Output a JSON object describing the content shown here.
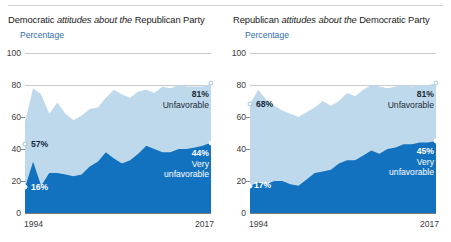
{
  "figure": {
    "background_color": "#ffffff",
    "divider_color": "#d2d2d2",
    "colors": {
      "unfavorable_area": "#bfd9ec",
      "very_unfavorable_area": "#1272bf",
      "accent_blue_text": "#2f6fad",
      "gridline": "#c9c9c9",
      "axis": "#7d7d7d",
      "label_dark": "#1c2b36",
      "label_white": "#ffffff"
    }
  },
  "panels": [
    {
      "id": "democratic-attitudes",
      "title_part1": "Democratic ",
      "title_em": "attitudes about the",
      "title_part2": " Republican Party",
      "unit_label": "Percentage",
      "y_ticks": [
        "100",
        "80",
        "60",
        "40",
        "20",
        "0"
      ],
      "x_ticks": {
        "start": "1994",
        "end": "2017"
      },
      "start_label_unfavorable": "57%",
      "start_label_very_unfavorable": "16%",
      "end_value_unfavorable": "81%",
      "end_name_unfavorable": "Unfavorable",
      "end_value_very_unfavorable": "44%",
      "end_name_very_unfavorable_line1": "Very",
      "end_name_very_unfavorable_line2": "unfavorable"
    },
    {
      "id": "republican-attitudes",
      "title_part1": "Republican ",
      "title_em": "attitudes about the",
      "title_part2": " Democratic Party",
      "unit_label": "Percentage",
      "y_ticks": [
        "100",
        "80",
        "60",
        "40",
        "20",
        "0"
      ],
      "x_ticks": {
        "start": "1994",
        "end": "2017"
      },
      "start_label_unfavorable": "68%",
      "start_label_very_unfavorable": "17%",
      "end_value_unfavorable": "81%",
      "end_name_unfavorable": "Unfavorable",
      "end_value_very_unfavorable": "45%",
      "end_name_very_unfavorable_line1": "Very",
      "end_name_very_unfavorable_line2": "unfavorable"
    }
  ],
  "chart_data": [
    {
      "type": "area",
      "title": "Democratic attitudes about the Republican Party",
      "subtitle": "Percentage",
      "xlabel": "",
      "ylabel": "Percentage",
      "ylim": [
        0,
        100
      ],
      "yticks": [
        0,
        20,
        40,
        60,
        80,
        100
      ],
      "grid": true,
      "gridlines_at": [
        80,
        100
      ],
      "legend_position": "inline-annotation",
      "stacked": false,
      "x": [
        1994,
        1995,
        1996,
        1997,
        1998,
        1999,
        2000,
        2001,
        2002,
        2003,
        2004,
        2005,
        2006,
        2007,
        2008,
        2009,
        2010,
        2011,
        2012,
        2013,
        2014,
        2015,
        2016,
        2017
      ],
      "series": [
        {
          "name": "Unfavorable",
          "color": "#bfd9ec",
          "values": [
            57,
            78,
            74,
            62,
            69,
            62,
            58,
            61,
            65,
            66,
            72,
            77,
            74,
            72,
            76,
            77,
            75,
            79,
            78,
            80,
            79,
            79,
            79,
            81
          ]
        },
        {
          "name": "Very unfavorable",
          "color": "#1272bf",
          "values": [
            16,
            32,
            17,
            25,
            25,
            24,
            23,
            24,
            29,
            32,
            38,
            34,
            31,
            33,
            37,
            42,
            40,
            38,
            38,
            40,
            40,
            41,
            42,
            44
          ]
        }
      ],
      "annotations": [
        {
          "text": "57%",
          "x": 1994,
          "y": 57,
          "series": "Unfavorable"
        },
        {
          "text": "16%",
          "x": 1994,
          "y": 16,
          "series": "Very unfavorable"
        },
        {
          "text": "81% Unfavorable",
          "x": 2017,
          "y": 81,
          "series": "Unfavorable"
        },
        {
          "text": "44% Very unfavorable",
          "x": 2017,
          "y": 44,
          "series": "Very unfavorable"
        }
      ]
    },
    {
      "type": "area",
      "title": "Republican attitudes about the Democratic Party",
      "subtitle": "Percentage",
      "xlabel": "",
      "ylabel": "Percentage",
      "ylim": [
        0,
        100
      ],
      "yticks": [
        0,
        20,
        40,
        60,
        80,
        100
      ],
      "grid": true,
      "gridlines_at": [
        80,
        100
      ],
      "legend_position": "inline-annotation",
      "stacked": false,
      "x": [
        1994,
        1995,
        1996,
        1997,
        1998,
        1999,
        2000,
        2001,
        2002,
        2003,
        2004,
        2005,
        2006,
        2007,
        2008,
        2009,
        2010,
        2011,
        2012,
        2013,
        2014,
        2015,
        2016,
        2017
      ],
      "series": [
        {
          "name": "Unfavorable",
          "color": "#bfd9ec",
          "values": [
            68,
            77,
            71,
            67,
            64,
            62,
            60,
            63,
            66,
            70,
            67,
            70,
            75,
            73,
            77,
            80,
            79,
            78,
            79,
            80,
            79,
            80,
            80,
            81
          ]
        },
        {
          "name": "Very unfavorable",
          "color": "#1272bf",
          "values": [
            17,
            19,
            18,
            20,
            20,
            18,
            17,
            21,
            25,
            26,
            27,
            31,
            33,
            33,
            36,
            39,
            37,
            40,
            41,
            43,
            43,
            44,
            44,
            45
          ]
        }
      ],
      "annotations": [
        {
          "text": "68%",
          "x": 1994,
          "y": 68,
          "series": "Unfavorable"
        },
        {
          "text": "17%",
          "x": 1994,
          "y": 17,
          "series": "Very unfavorable"
        },
        {
          "text": "81% Unfavorable",
          "x": 2017,
          "y": 81,
          "series": "Unfavorable"
        },
        {
          "text": "45% Very unfavorable",
          "x": 2017,
          "y": 45,
          "series": "Very unfavorable"
        }
      ]
    }
  ]
}
